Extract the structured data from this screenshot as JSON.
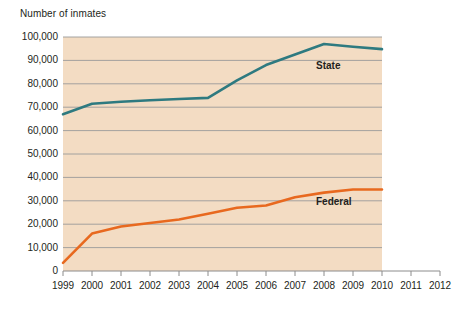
{
  "chart_data": {
    "type": "line",
    "title": "Number of inmates",
    "xlabel": "",
    "ylabel": "Number of inmates",
    "grid": true,
    "legend_position": "inline-labels",
    "x": [
      1999,
      2000,
      2001,
      2002,
      2003,
      2004,
      2005,
      2006,
      2007,
      2008,
      2009,
      2010
    ],
    "x_tick_labels": [
      "1999",
      "2000",
      "2001",
      "2002",
      "2003",
      "2004",
      "2005",
      "2006",
      "2007",
      "2008",
      "2009",
      "2010",
      "2011",
      "2012"
    ],
    "y_tick_labels": [
      "100,000",
      "90,000",
      "80,000",
      "70,000",
      "60,000",
      "50,000",
      "40,000",
      "30,000",
      "20,000",
      "10,000",
      "0"
    ],
    "y_tick_values": [
      100000,
      90000,
      80000,
      70000,
      60000,
      50000,
      40000,
      30000,
      20000,
      10000,
      0
    ],
    "xlim": [
      1999,
      2012
    ],
    "ylim": [
      0,
      100000
    ],
    "series": [
      {
        "name": "State",
        "color": "#2e7a80",
        "label_text": "State",
        "values": [
          67000,
          71500,
          72300,
          73000,
          73500,
          74000,
          81500,
          88000,
          92500,
          97000,
          95800,
          94800
        ]
      },
      {
        "name": "Federal",
        "color": "#e8691f",
        "label_text": "Federal",
        "values": [
          3500,
          16000,
          19000,
          20500,
          22000,
          24500,
          27000,
          28000,
          31500,
          33500,
          34800,
          34800
        ]
      }
    ],
    "plot_background_color": "#f3dcc3",
    "gridline_color": "#9a9a9a",
    "axis_color": "#8c8c8c"
  }
}
